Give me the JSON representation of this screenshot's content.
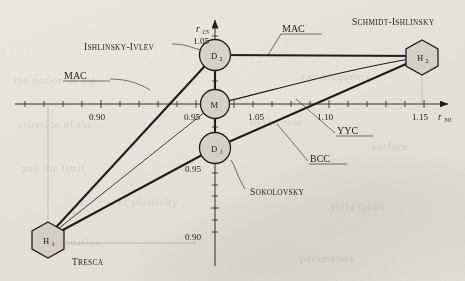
{
  "figure": {
    "background_color": "#e8e6e1",
    "ink_color": "#201e1c",
    "node_fill": "#d7d4ce"
  },
  "axes": {
    "x": {
      "name": "r",
      "subscript": "30",
      "ticks": [
        "0.90",
        "0.95",
        "1.05",
        "1.10",
        "1.15"
      ]
    },
    "y": {
      "name": "r",
      "subscript": "15",
      "ticks": [
        "1.05",
        "0.95",
        "0.90"
      ]
    }
  },
  "nodes": [
    {
      "id": "H1",
      "label": "H",
      "sub": "1",
      "shape": "hexagon",
      "caption": "Tresca"
    },
    {
      "id": "D1",
      "label": "D",
      "sub": "1",
      "shape": "circle",
      "caption": ""
    },
    {
      "id": "M",
      "label": "M",
      "sub": "",
      "shape": "circle",
      "caption": ""
    },
    {
      "id": "D2",
      "label": "D",
      "sub": "2",
      "shape": "circle",
      "caption": "Ishlinsky-Ivlev"
    },
    {
      "id": "H2",
      "label": "H",
      "sub": "2",
      "shape": "hexagon",
      "caption": "Schmidt-Ishlinsky"
    }
  ],
  "callouts": {
    "schmidt_ishlinsky": "Schmidt-Ishlinsky",
    "ishlinsky_ivlev": "Ishlinsky-Ivlev",
    "tresca": "Tresca",
    "sokolovsky": "Sokolovsky",
    "mac_top": "MAC",
    "mac_left": "MAC",
    "yyc": "YYC",
    "bcc": "BCC"
  },
  "chart_data": {
    "type": "line",
    "title": "",
    "xlabel": "r30",
    "ylabel": "r15",
    "xlim": [
      0.875,
      1.175
    ],
    "ylim": [
      0.885,
      1.065
    ],
    "grid": false,
    "legend": "none",
    "xticks": [
      0.9,
      0.95,
      1.05,
      1.1,
      1.15
    ],
    "yticks": [
      0.9,
      0.95,
      1.05
    ],
    "points": [
      {
        "name": "H1",
        "label": "Tresca",
        "x": 0.878,
        "y": 0.894
      },
      {
        "name": "D1",
        "label": "D1",
        "x": 1.0,
        "y": 0.957
      },
      {
        "name": "M",
        "label": "M",
        "x": 1.0,
        "y": 1.0
      },
      {
        "name": "D2",
        "label": "Ishlinsky-Ivlev",
        "x": 1.0,
        "y": 1.043
      },
      {
        "name": "H2",
        "label": "Schmidt-Ishlinsky",
        "x": 1.148,
        "y": 1.043
      }
    ],
    "series": [
      {
        "name": "MAC",
        "from": "H1",
        "to": "D2",
        "shape": "straight"
      },
      {
        "name": "MAC",
        "from": "D2",
        "to": "H2",
        "shape": "straight"
      },
      {
        "name": "Sokolovsky",
        "from": "H1",
        "to": "D1",
        "shape": "straight"
      },
      {
        "name": "BCC",
        "from": "D1",
        "to": "H2",
        "shape": "straight"
      },
      {
        "name": "YYC",
        "from": "M",
        "to": "H2",
        "shape": "curved-concave"
      },
      {
        "name": "axis-M",
        "from": "H1",
        "to": "M",
        "shape": "straight-thin"
      }
    ]
  },
  "bleed_text": [
    {
      "text": "the notion of the",
      "x": 14,
      "y": 74
    },
    {
      "text": "a consequence",
      "x": 300,
      "y": 70
    },
    {
      "text": "criterion of the",
      "x": 18,
      "y": 118
    },
    {
      "text": "in the case",
      "x": 250,
      "y": 116
    },
    {
      "text": "surface",
      "x": 372,
      "y": 140
    },
    {
      "text": "and the limit",
      "x": 22,
      "y": 162
    },
    {
      "text": "of plasticity",
      "x": 118,
      "y": 196
    },
    {
      "text": "yield locus",
      "x": 330,
      "y": 200
    },
    {
      "text": "the equation",
      "x": 40,
      "y": 236
    },
    {
      "text": "parameters",
      "x": 300,
      "y": 252
    }
  ]
}
